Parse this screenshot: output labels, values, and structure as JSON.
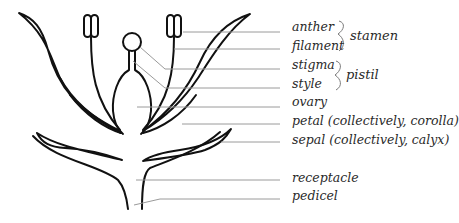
{
  "diagram": {
    "labels": [
      {
        "id": "anther",
        "text": "anther",
        "y": 31
      },
      {
        "id": "filament",
        "text": "filament",
        "y": 49
      },
      {
        "id": "stigma",
        "text": "stigma",
        "y": 68
      },
      {
        "id": "style",
        "text": "style",
        "y": 87
      },
      {
        "id": "ovary",
        "text": "ovary",
        "y": 105
      },
      {
        "id": "petal",
        "text": "petal (collectively, corolla)",
        "y": 124
      },
      {
        "id": "sepal",
        "text": "sepal (collectively, calyx)",
        "y": 143
      },
      {
        "id": "receptacle",
        "text": "receptacle",
        "y": 181
      },
      {
        "id": "pedicel",
        "text": "pedicel",
        "y": 199
      }
    ],
    "groups": [
      {
        "id": "stamen",
        "text": "stamen",
        "members": [
          "anther",
          "filament"
        ]
      },
      {
        "id": "pistil",
        "text": "pistil",
        "members": [
          "stigma",
          "style"
        ]
      }
    ],
    "colors": {
      "outline": "#111111",
      "leader_line": "#9a9a9a",
      "text": "#2a2a2a",
      "brace": "#7a7a7a"
    }
  }
}
